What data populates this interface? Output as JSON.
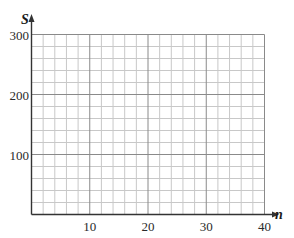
{
  "chart_data": {
    "type": "line",
    "title": "",
    "xlabel": "n",
    "ylabel": "S",
    "xlim": [
      0,
      40
    ],
    "ylim": [
      0,
      300
    ],
    "x_ticks": [
      10,
      20,
      30,
      40
    ],
    "y_ticks": [
      100,
      200,
      300
    ],
    "x_tick_labels": [
      "10",
      "20",
      "30",
      "40"
    ],
    "y_tick_labels": [
      "100",
      "200",
      "300"
    ],
    "grid": true,
    "grid_minor_x_step": 2,
    "grid_minor_y_step": 20,
    "grid_major_x_step": 10,
    "grid_major_y_step": 100,
    "series": [],
    "legend": null
  },
  "colors": {
    "axis": "#333333",
    "major_grid": "#8a8a8a",
    "minor_grid": "#c8c8c8",
    "text": "#2a2a2a"
  }
}
